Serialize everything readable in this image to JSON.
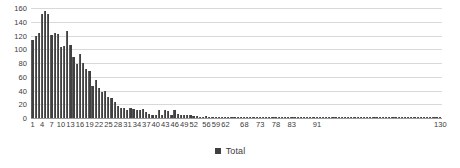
{
  "chart_data": {
    "type": "bar",
    "title": "",
    "subtitle": "",
    "xlabel": "",
    "ylabel": "",
    "grid": true,
    "legend_position": "bottom",
    "ylim": [
      0,
      160
    ],
    "y_ticks": [
      160,
      140,
      120,
      100,
      80,
      60,
      40,
      20,
      0
    ],
    "x_tick_labels": [
      "1",
      "4",
      "7",
      "10",
      "13",
      "16",
      "19",
      "22",
      "25",
      "28",
      "31",
      "34",
      "37",
      "40",
      "43",
      "46",
      "49",
      "52",
      "56",
      "59",
      "62",
      "68",
      "73",
      "78",
      "83",
      "91",
      "130"
    ],
    "x_tick_every": 3,
    "series": [
      {
        "name": "Total",
        "color": "#404040",
        "categories": [
          "1",
          "2",
          "3",
          "4",
          "5",
          "6",
          "7",
          "8",
          "9",
          "10",
          "11",
          "12",
          "13",
          "14",
          "15",
          "16",
          "17",
          "18",
          "19",
          "20",
          "21",
          "22",
          "23",
          "24",
          "25",
          "26",
          "27",
          "28",
          "29",
          "30",
          "31",
          "32",
          "33",
          "34",
          "35",
          "36",
          "37",
          "38",
          "39",
          "40",
          "41",
          "42",
          "43",
          "44",
          "45",
          "46",
          "47",
          "48",
          "49",
          "50",
          "51",
          "52",
          "53",
          "54",
          "55",
          "56",
          "57",
          "58",
          "59",
          "60",
          "61",
          "62",
          "63",
          "64",
          "65",
          "66",
          "67",
          "68",
          "69",
          "70",
          "71",
          "72",
          "73",
          "74",
          "75",
          "76",
          "77",
          "78",
          "79",
          "80",
          "81",
          "82",
          "83",
          "84",
          "85",
          "86",
          "87",
          "88",
          "89",
          "90",
          "91",
          "92",
          "93",
          "94",
          "95",
          "96",
          "97",
          "98",
          "99",
          "100",
          "101",
          "102",
          "103",
          "104",
          "105",
          "106",
          "107",
          "108",
          "109",
          "110",
          "111",
          "112",
          "113",
          "114",
          "115",
          "116",
          "117",
          "118",
          "119",
          "120",
          "121",
          "122",
          "123",
          "124",
          "125",
          "126",
          "127",
          "128",
          "129",
          "130"
        ],
        "values": [
          114,
          120,
          124,
          152,
          155,
          151,
          121,
          123,
          122,
          104,
          105,
          126,
          106,
          89,
          79,
          93,
          80,
          71,
          69,
          46,
          56,
          43,
          38,
          39,
          31,
          29,
          24,
          17,
          15,
          14,
          12,
          14,
          13,
          12,
          12,
          13,
          9,
          6,
          5,
          4,
          12,
          4,
          11,
          10,
          4,
          12,
          6,
          4,
          5,
          4,
          4,
          3,
          3,
          2,
          2,
          3,
          2,
          2,
          2,
          2,
          2,
          2,
          1,
          2,
          1,
          2,
          1,
          2,
          1,
          1,
          1,
          1,
          2,
          1,
          1,
          1,
          1,
          1,
          1,
          1,
          1,
          1,
          1,
          1,
          1,
          1,
          1,
          1,
          1,
          1,
          1,
          1,
          1,
          1,
          1,
          1,
          1,
          1,
          1,
          1,
          1,
          1,
          1,
          1,
          1,
          1,
          1,
          1,
          1,
          1,
          1,
          1,
          1,
          1,
          1,
          1,
          1,
          1,
          1,
          1,
          1,
          1,
          1,
          1,
          1,
          1,
          1,
          1,
          1,
          1
        ]
      }
    ]
  },
  "legend": {
    "entries": [
      {
        "label": "Total",
        "color": "#404040",
        "marker": "square-marker"
      }
    ]
  }
}
